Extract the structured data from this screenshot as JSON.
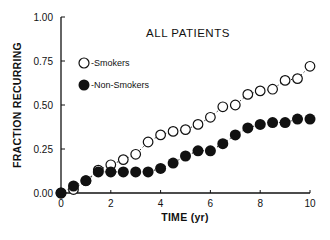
{
  "chart_data": {
    "type": "scatter",
    "title": "ALL PATIENTS",
    "xlabel": "TIME (yr)",
    "ylabel": "FRACTION RECURRING",
    "xlim": [
      0,
      10
    ],
    "ylim": [
      0,
      1.0
    ],
    "x_ticks": [
      "0",
      "2",
      "4",
      "6",
      "8",
      "10"
    ],
    "y_ticks": [
      "0.00",
      "0.25",
      "0.50",
      "0.75",
      "1.00"
    ],
    "grid": false,
    "legend_position": "upper-left",
    "x": [
      0,
      0.5,
      1,
      1.5,
      2,
      2.5,
      3,
      3.5,
      4,
      4.5,
      5,
      5.5,
      6,
      6.5,
      7,
      7.5,
      8,
      8.5,
      9,
      9.5,
      10
    ],
    "series": [
      {
        "name": "Smokers",
        "legend_label": "-Smokers",
        "marker": "open-circle",
        "line": "dotted",
        "values": [
          0,
          0.02,
          0.07,
          0.13,
          0.16,
          0.19,
          0.22,
          0.29,
          0.33,
          0.35,
          0.36,
          0.39,
          0.43,
          0.49,
          0.5,
          0.56,
          0.58,
          0.59,
          0.64,
          0.65,
          0.72
        ]
      },
      {
        "name": "Non-Smokers",
        "legend_label": "-Non-Smokers",
        "marker": "filled-circle",
        "line": "dotted",
        "values": [
          0,
          0.04,
          0.07,
          0.12,
          0.12,
          0.12,
          0.12,
          0.12,
          0.14,
          0.17,
          0.21,
          0.24,
          0.24,
          0.28,
          0.33,
          0.37,
          0.39,
          0.4,
          0.4,
          0.42,
          0.42
        ]
      }
    ]
  },
  "colors": {
    "ink": "#111111",
    "background": "#ffffff"
  }
}
